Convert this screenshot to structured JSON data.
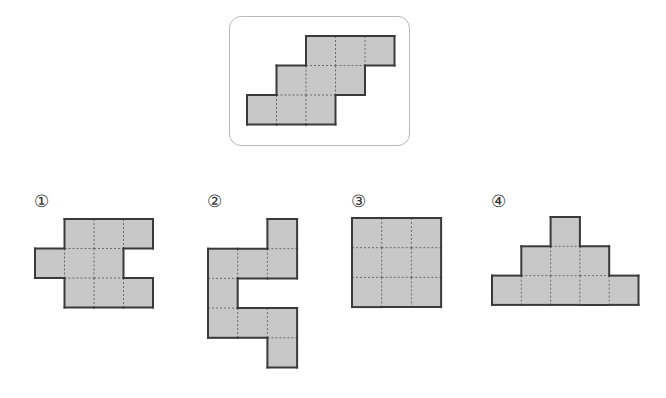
{
  "colors": {
    "fill": "#c8c8c8",
    "outline": "#3a3a3a",
    "dash": "#6a6a6a",
    "frame": "#b9b9b9"
  },
  "reference": {
    "label": "reference shape",
    "cell_size": 29.5,
    "origin": [
      247,
      36
    ],
    "cells": [
      [
        0,
        2
      ],
      [
        0,
        3
      ],
      [
        0,
        4
      ],
      [
        1,
        1
      ],
      [
        1,
        2
      ],
      [
        1,
        3
      ],
      [
        2,
        0
      ],
      [
        2,
        1
      ],
      [
        2,
        2
      ]
    ]
  },
  "options": [
    {
      "label": "①",
      "label_pos": [
        34,
        193
      ],
      "origin": [
        35,
        219
      ],
      "cell_size": 29.5,
      "cells": [
        [
          0,
          1
        ],
        [
          0,
          2
        ],
        [
          0,
          3
        ],
        [
          1,
          0
        ],
        [
          1,
          1
        ],
        [
          1,
          2
        ],
        [
          2,
          1
        ],
        [
          2,
          2
        ],
        [
          2,
          3
        ]
      ]
    },
    {
      "label": "②",
      "label_pos": [
        207,
        193
      ],
      "origin": [
        208,
        219
      ],
      "cell_size": 29.7,
      "cells": [
        [
          0,
          2
        ],
        [
          1,
          0
        ],
        [
          1,
          1
        ],
        [
          1,
          2
        ],
        [
          2,
          0
        ],
        [
          3,
          0
        ],
        [
          3,
          1
        ],
        [
          3,
          2
        ],
        [
          4,
          2
        ]
      ]
    },
    {
      "label": "③",
      "label_pos": [
        351,
        193
      ],
      "origin": [
        352,
        218
      ],
      "cell_size": 29.7,
      "cells": [
        [
          0,
          0
        ],
        [
          0,
          1
        ],
        [
          0,
          2
        ],
        [
          1,
          0
        ],
        [
          1,
          1
        ],
        [
          1,
          2
        ],
        [
          2,
          0
        ],
        [
          2,
          1
        ],
        [
          2,
          2
        ]
      ]
    },
    {
      "label": "④",
      "label_pos": [
        491,
        193
      ],
      "origin": [
        492,
        217
      ],
      "cell_size": 29.3,
      "cells": [
        [
          0,
          2
        ],
        [
          1,
          1
        ],
        [
          1,
          2
        ],
        [
          1,
          3
        ],
        [
          2,
          0
        ],
        [
          2,
          1
        ],
        [
          2,
          2
        ],
        [
          2,
          3
        ],
        [
          2,
          4
        ]
      ]
    }
  ]
}
